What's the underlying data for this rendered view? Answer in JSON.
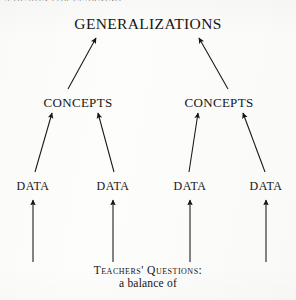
{
  "page": {
    "running_head": "A DESIGN FOR LEARNING",
    "background_color": "#fdfdfc",
    "ink_color": "#151515"
  },
  "diagram": {
    "type": "hierarchy-flow",
    "direction": "bottom-up",
    "title_node": "GENERALIZATIONS",
    "levels": [
      {
        "level": 1,
        "name": "generalizations-level",
        "nodes": [
          {
            "label": "GENERALIZATIONS",
            "x": 148,
            "y": 24
          }
        ]
      },
      {
        "level": 2,
        "name": "concepts-level",
        "nodes": [
          {
            "label": "CONCEPTS",
            "x": 78,
            "y": 103
          },
          {
            "label": "CONCEPTS",
            "x": 219,
            "y": 103
          }
        ]
      },
      {
        "level": 3,
        "name": "data-level",
        "nodes": [
          {
            "label": "DATA",
            "x": 33,
            "y": 186
          },
          {
            "label": "DATA",
            "x": 113,
            "y": 186
          },
          {
            "label": "DATA",
            "x": 190,
            "y": 186
          },
          {
            "label": "DATA",
            "x": 266,
            "y": 186
          }
        ]
      }
    ],
    "arrows": [
      {
        "name": "arrow-concepts-left-to-generalizations",
        "x1": 68,
        "y1": 89,
        "x2": 96,
        "y2": 38
      },
      {
        "name": "arrow-concepts-right-to-generalizations",
        "x1": 228,
        "y1": 89,
        "x2": 199,
        "y2": 38
      },
      {
        "name": "arrow-data1-to-concepts-left",
        "x1": 35,
        "y1": 172,
        "x2": 52,
        "y2": 113
      },
      {
        "name": "arrow-data2-to-concepts-left",
        "x1": 114,
        "y1": 172,
        "x2": 98,
        "y2": 113
      },
      {
        "name": "arrow-data3-to-concepts-right",
        "x1": 189,
        "y1": 172,
        "x2": 198,
        "y2": 113
      },
      {
        "name": "arrow-data4-to-concepts-right",
        "x1": 265,
        "y1": 172,
        "x2": 243,
        "y2": 113
      },
      {
        "name": "arrow-questions-to-data1",
        "x1": 33,
        "y1": 262,
        "x2": 33,
        "y2": 200
      },
      {
        "name": "arrow-questions-to-data2",
        "x1": 113,
        "y1": 262,
        "x2": 113,
        "y2": 200
      },
      {
        "name": "arrow-questions-to-data3",
        "x1": 190,
        "y1": 262,
        "x2": 190,
        "y2": 200
      },
      {
        "name": "arrow-questions-to-data4",
        "x1": 266,
        "y1": 262,
        "x2": 266,
        "y2": 200
      }
    ]
  },
  "caption": {
    "line1": "Teachers' Questions:",
    "line2": "a balance of"
  }
}
